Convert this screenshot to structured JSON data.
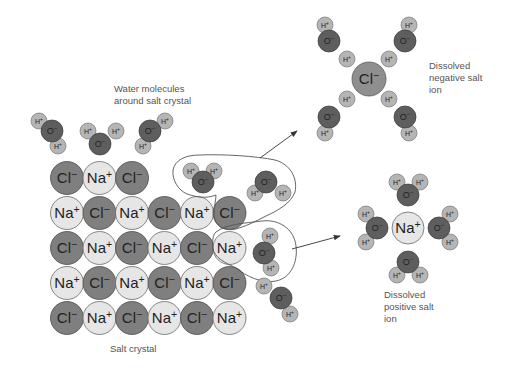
{
  "labels": {
    "water_molecules": [
      "Water molecules",
      "around salt crystal"
    ],
    "salt_crystal": "Salt crystal",
    "dissolved_negative": [
      "Dissolved",
      "negative salt",
      "ion"
    ],
    "dissolved_positive": [
      "Dissolved",
      "positive salt",
      "ion"
    ]
  },
  "ion_text": {
    "Cl": "Cl−",
    "Na": "Na+",
    "O": "O−",
    "H": "H+"
  },
  "colors": {
    "cl_fill": "#7f7f7f",
    "na_fill": "#e6e6e6",
    "o_fill": "#5e5e5e",
    "h_fill": "#b5b5b5",
    "line": "#555555",
    "text": "#555555"
  },
  "crystal": {
    "origin": [
      67,
      178
    ],
    "dx": 32.5,
    "dy": 35,
    "radius": 16.5,
    "rows": [
      [
        "Cl",
        "Na",
        "Cl"
      ],
      [
        "Na",
        "Cl",
        "Na",
        "Cl",
        "Na",
        "Cl"
      ],
      [
        "Cl",
        "Na",
        "Cl",
        "Na",
        "Cl",
        "Na"
      ],
      [
        "Na",
        "Cl",
        "Na",
        "Cl",
        "Na",
        "Cl"
      ],
      [
        "Cl",
        "Na",
        "Cl",
        "Na",
        "Cl",
        "Na"
      ]
    ]
  },
  "water_molecules": [
    {
      "o": [
        52,
        131
      ],
      "h": [
        [
          39,
          121
        ],
        [
          58,
          146
        ]
      ]
    },
    {
      "o": [
        100,
        144
      ],
      "h": [
        [
          88,
          131
        ],
        [
          116,
          131
        ]
      ]
    },
    {
      "o": [
        150,
        131
      ],
      "h": [
        [
          165,
          121
        ],
        [
          143,
          146
        ]
      ]
    },
    {
      "o": [
        203,
        182
      ],
      "h": [
        [
          191,
          171
        ],
        [
          214,
          171
        ]
      ]
    },
    {
      "o": [
        266,
        182
      ],
      "h": [
        [
          255,
          193
        ],
        [
          283,
          193
        ]
      ]
    },
    {
      "o": [
        264,
        253
      ],
      "h": [
        [
          270,
          236
        ],
        [
          271,
          268
        ]
      ]
    },
    {
      "o": [
        281,
        298
      ],
      "h": [
        [
          264,
          286
        ],
        [
          290,
          314
        ]
      ]
    },
    {
      "o": [
        329,
        41
      ],
      "h": [
        [
          325,
          25
        ],
        [
          347,
          59
        ]
      ]
    },
    {
      "o": [
        405,
        41
      ],
      "h": [
        [
          409,
          25
        ],
        [
          389,
          59
        ]
      ]
    },
    {
      "o": [
        329,
        117
      ],
      "h": [
        [
          347,
          99
        ],
        [
          325,
          133
        ]
      ]
    },
    {
      "o": [
        405,
        117
      ],
      "h": [
        [
          389,
          99
        ],
        [
          409,
          133
        ]
      ]
    },
    {
      "o": [
        408,
        195
      ],
      "h": [
        [
          397,
          182
        ],
        [
          420,
          182
        ]
      ]
    },
    {
      "o": [
        377,
        228
      ],
      "h": [
        [
          366,
          214
        ],
        [
          366,
          242
        ]
      ]
    },
    {
      "o": [
        439,
        228
      ],
      "h": [
        [
          450,
          214
        ],
        [
          450,
          242
        ]
      ]
    },
    {
      "o": [
        408,
        262
      ],
      "h": [
        [
          397,
          275
        ],
        [
          420,
          275
        ]
      ]
    }
  ],
  "dissolved_ions": [
    {
      "type": "Cl",
      "center": [
        369,
        79
      ],
      "radius": 17
    },
    {
      "type": "Na",
      "center": [
        408,
        228
      ],
      "radius": 16
    }
  ],
  "arrows": [
    {
      "from": [
        260,
        158
      ],
      "to": [
        297,
        131
      ]
    },
    {
      "from": [
        292,
        249
      ],
      "to": [
        340,
        236
      ]
    }
  ]
}
